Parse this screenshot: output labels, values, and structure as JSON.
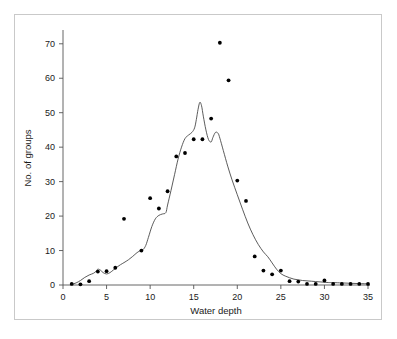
{
  "chart_data": {
    "type": "scatter",
    "title": "",
    "xlabel": "Water depth",
    "ylabel": "No. of groups",
    "xlim": [
      0,
      35
    ],
    "ylim": [
      0,
      74
    ],
    "grid": false,
    "legend": "none",
    "xticks": [
      0,
      5,
      10,
      15,
      20,
      25,
      30,
      35
    ],
    "yticks": [
      0,
      10,
      20,
      30,
      40,
      50,
      60,
      70
    ],
    "xtick_labels": [
      "0",
      "5",
      "10",
      "15",
      "20",
      "25",
      "30",
      "35"
    ],
    "ytick_labels": [
      "0",
      "10",
      "20",
      "30",
      "40",
      "50",
      "60",
      "70"
    ],
    "series": [
      {
        "name": "No. of groups",
        "marker": "filled-circle",
        "color": "#000000",
        "x": [
          1,
          2,
          3,
          4,
          5,
          6,
          7,
          8,
          9,
          10,
          11,
          12,
          13,
          14,
          15,
          16,
          17,
          18,
          19,
          20,
          21,
          22,
          23,
          24,
          25,
          26,
          27,
          28,
          29,
          30,
          31,
          32,
          33,
          34,
          35
        ],
        "y": [
          0.3,
          0.2,
          1.1,
          3.9,
          4.0,
          5.0,
          19.2,
          0,
          10.0,
          25.2,
          22.2,
          27.2,
          37.3,
          38.3,
          42.3,
          42.3,
          48.3,
          70.3,
          59.4,
          30.3,
          24.4,
          8.3,
          4.2,
          3.1,
          4.2,
          1.1,
          1.0,
          0.3,
          0.3,
          1.3,
          0.3,
          0.3,
          0.3,
          0.3,
          0.3
        ]
      }
    ],
    "curve": {
      "name": "smoothed density curve",
      "color": "#4a4a4a",
      "x": [
        1.0,
        1.5,
        2.0,
        2.5,
        3.0,
        3.5,
        3.8,
        4.0,
        4.3,
        4.6,
        5.0,
        5.4,
        5.8,
        6.2,
        6.6,
        7.0,
        7.5,
        8.0,
        8.5,
        8.9,
        9.2,
        9.5,
        9.8,
        10.2,
        10.6,
        11.0,
        11.4,
        11.8,
        12.0,
        12.4,
        12.8,
        13.2,
        13.6,
        14.0,
        14.4,
        14.8,
        15.1,
        15.3,
        15.5,
        15.7,
        15.9,
        16.1,
        16.4,
        16.7,
        17.0,
        17.2,
        17.5,
        17.8,
        18.0,
        18.4,
        18.9,
        19.4,
        20.0,
        20.6,
        21.2,
        21.8,
        22.4,
        23.0,
        23.5,
        24.0,
        24.5,
        25.0,
        25.5,
        26.0,
        26.5,
        27.0,
        27.5,
        28.0,
        28.5,
        29.0,
        29.5,
        30.0,
        30.5,
        31.0,
        32.0,
        33.0,
        34.0,
        35.0
      ],
      "y": [
        0.2,
        0.6,
        1.3,
        2.2,
        2.9,
        3.4,
        4.0,
        4.6,
        4.3,
        3.6,
        3.2,
        3.6,
        4.4,
        5.2,
        5.9,
        6.5,
        7.3,
        8.3,
        9.4,
        10.0,
        10.3,
        11.5,
        13.8,
        17.0,
        19.2,
        20.2,
        20.6,
        21.0,
        23.2,
        27.5,
        32.0,
        36.5,
        40.0,
        42.5,
        43.5,
        44.3,
        45.6,
        48.0,
        51.0,
        53.0,
        52.0,
        49.0,
        45.0,
        42.2,
        41.5,
        42.8,
        44.3,
        44.0,
        42.6,
        39.0,
        34.5,
        30.5,
        26.2,
        22.0,
        18.0,
        14.6,
        11.8,
        9.6,
        8.2,
        6.4,
        4.6,
        3.3,
        2.6,
        2.1,
        1.7,
        1.5,
        1.3,
        1.2,
        1.1,
        1.0,
        0.9,
        0.8,
        0.7,
        0.7,
        0.6,
        0.5,
        0.4,
        0.35
      ]
    }
  },
  "figure": {
    "background_color": "#ffffff",
    "frame_color": "#c9c9c9",
    "axis_color": "#555555",
    "point_color": "#000000",
    "curve_color": "#4a4a4a"
  }
}
